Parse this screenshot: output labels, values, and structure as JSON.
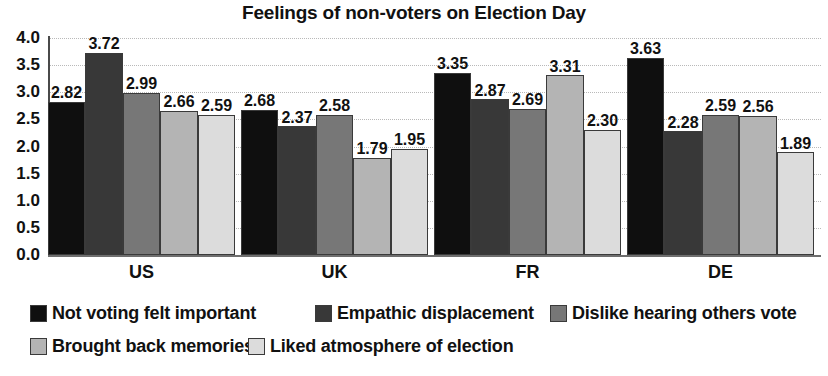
{
  "chart_data": {
    "type": "bar",
    "title": "Feelings of non-voters on Election Day",
    "xlabel": "",
    "ylabel": "",
    "ylim": [
      0,
      4
    ],
    "ytick_labels": [
      "4.0",
      "3.5",
      "3.0",
      "2.5",
      "2.0",
      "1.5",
      "1.0",
      "0.5",
      "0.0"
    ],
    "ytick_values": [
      4.0,
      3.5,
      3.0,
      2.5,
      2.0,
      1.5,
      1.0,
      0.5,
      0.0
    ],
    "grid": true,
    "legend_position": "bottom",
    "categories": [
      "US",
      "UK",
      "FR",
      "DE"
    ],
    "series": [
      {
        "name": "Not voting felt important",
        "color": "#0f0f0f",
        "values": [
          2.82,
          2.68,
          3.35,
          3.63
        ],
        "labels": [
          "2.82",
          "2.68",
          "3.35",
          "3.63"
        ]
      },
      {
        "name": "Empathic displacement",
        "color": "#383838",
        "values": [
          3.72,
          2.37,
          2.87,
          2.28
        ],
        "labels": [
          "3.72",
          "2.37",
          "2.87",
          "2.28"
        ]
      },
      {
        "name": "Dislike hearing others vote",
        "color": "#777777",
        "values": [
          2.99,
          2.58,
          2.69,
          2.59
        ],
        "labels": [
          "2.99",
          "2.58",
          "2.69",
          "2.59"
        ]
      },
      {
        "name": "Brought back memories",
        "color": "#b4b4b4",
        "values": [
          2.66,
          1.79,
          3.31,
          2.56
        ],
        "labels": [
          "2.66",
          "1.79",
          "3.31",
          "2.56"
        ]
      },
      {
        "name": "Liked atmosphere of election",
        "color": "#dcdcdc",
        "values": [
          2.59,
          1.95,
          2.3,
          1.89
        ],
        "labels": [
          "2.59",
          "1.95",
          "2.30",
          "1.89"
        ]
      }
    ]
  },
  "legend": {
    "rows": [
      [
        {
          "label": "Not voting felt important",
          "color": "#0f0f0f",
          "left": 0
        },
        {
          "label": "Empathic displacement",
          "color": "#383838",
          "left": 285
        },
        {
          "label": "Dislike hearing others vote",
          "color": "#777777",
          "left": 520
        }
      ],
      [
        {
          "label": "Brought back memories",
          "color": "#b4b4b4",
          "left": 0
        },
        {
          "label": "Liked atmosphere of election",
          "color": "#dcdcdc",
          "left": 218
        }
      ]
    ]
  }
}
